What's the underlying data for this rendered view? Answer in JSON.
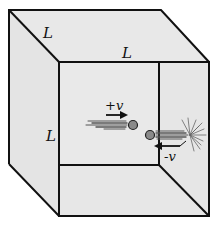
{
  "diagram": {
    "colors": {
      "face": "#e6e6e6",
      "edge": "#111111",
      "ball": "#8a8a8a",
      "trail": "#555555"
    },
    "labels": {
      "depth_edge": "L",
      "top_edge": "L",
      "side_edge": "L",
      "velocity_in": "+v",
      "velocity_out": "-v"
    },
    "elements": [
      {
        "name": "cube",
        "type": "box",
        "side": "L"
      },
      {
        "name": "molecule-incoming",
        "velocity": "+v",
        "direction": "right"
      },
      {
        "name": "molecule-rebound",
        "velocity": "-v",
        "direction": "left"
      },
      {
        "name": "wall-collision-burst",
        "location": "right wall"
      }
    ]
  }
}
